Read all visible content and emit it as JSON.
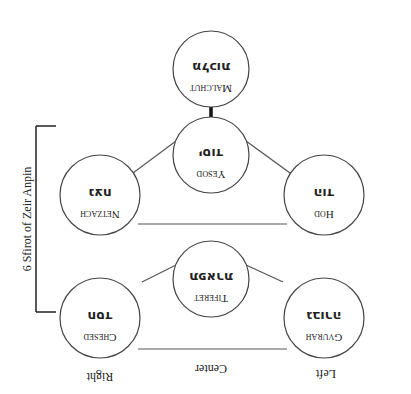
{
  "diagram": {
    "title": "6 Sfirot of Zeir Anpin",
    "orientation": "rotated 180 degrees",
    "columns": {
      "right": "Right",
      "center": "Center",
      "left": "Left"
    },
    "sefirot": [
      {
        "id": "malchut",
        "name": "Malchut",
        "hebrew": "מלכות",
        "column": "center"
      },
      {
        "id": "yesod",
        "name": "Yesod",
        "hebrew": "יסוד",
        "column": "center"
      },
      {
        "id": "netzach",
        "name": "Netzach",
        "hebrew": "נצח",
        "column": "right"
      },
      {
        "id": "hod",
        "name": "Hod",
        "hebrew": "הוד",
        "column": "left"
      },
      {
        "id": "tiferet",
        "name": "Tiferet",
        "hebrew": "תפארת",
        "column": "center"
      },
      {
        "id": "chesed",
        "name": "Chesed",
        "hebrew": "חסד",
        "column": "right"
      },
      {
        "id": "gvurah",
        "name": "Gvurah",
        "hebrew": "גבורה",
        "column": "left"
      }
    ],
    "bracket_label": "6 Sfirot of Zeir Anpin",
    "colors": {
      "stroke": "#444444",
      "text": "#222222",
      "background": "#ffffff"
    }
  }
}
